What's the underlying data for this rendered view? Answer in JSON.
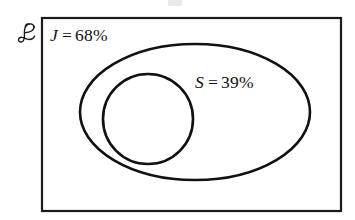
{
  "figure": {
    "type": "venn-diagram",
    "background_color": "#ffffff",
    "stroke_color": "#111111",
    "width": 355,
    "height": 220
  },
  "universe": {
    "symbol": "E",
    "symbol_name": "script-capital-e",
    "symbol_unicode": "ℰ",
    "meaning": "universal set",
    "rect": {
      "x": 42,
      "y": 18,
      "width": 299,
      "height": 193
    }
  },
  "sets": [
    {
      "id": "J",
      "shape": "ellipse",
      "variable": "J",
      "operator": "=",
      "value": "68%",
      "label": "J = 68%",
      "cx": 195,
      "cy": 112,
      "rx": 115,
      "ry": 68
    },
    {
      "id": "S",
      "shape": "circle",
      "variable": "S",
      "operator": "=",
      "value": "39%",
      "label": "S = 39%",
      "cx": 148,
      "cy": 119,
      "r": 45
    }
  ]
}
